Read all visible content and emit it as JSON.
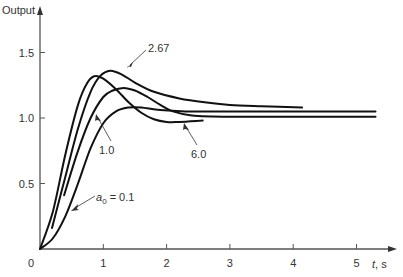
{
  "chart_data": {
    "type": "line",
    "title": "",
    "xlabel": "t, s",
    "ylabel": "Output",
    "xlim": [
      0,
      5.5
    ],
    "ylim": [
      0,
      1.6
    ],
    "grid": false,
    "legend": "inline annotations with arrows",
    "x_ticks": [
      {
        "value": 0,
        "label": "0"
      },
      {
        "value": 1,
        "label": "1"
      },
      {
        "value": 2,
        "label": "2"
      },
      {
        "value": 3,
        "label": "3"
      },
      {
        "value": 4,
        "label": "4"
      },
      {
        "value": 5,
        "label": "5"
      }
    ],
    "y_ticks": [
      {
        "value": 0.5,
        "label": "0.5"
      },
      {
        "value": 1.0,
        "label": "1.0"
      },
      {
        "value": 1.5,
        "label": "1.5"
      }
    ],
    "series": [
      {
        "name": "a0 = 6.0",
        "label": "6.0",
        "x": [
          0.0,
          0.2,
          0.4,
          0.6,
          0.75,
          0.87,
          1.0,
          1.2,
          1.4,
          1.6,
          1.8,
          2.0,
          2.2,
          2.57
        ],
        "y": [
          0.0,
          0.28,
          0.72,
          1.1,
          1.27,
          1.32,
          1.3,
          1.22,
          1.12,
          1.04,
          0.99,
          0.97,
          0.97,
          0.98
        ]
      },
      {
        "name": "a0 = 2.67",
        "label": "2.67",
        "x": [
          0.19,
          0.4,
          0.6,
          0.8,
          0.95,
          1.11,
          1.3,
          1.5,
          1.8,
          2.2,
          2.6,
          3.0,
          3.5,
          4.14
        ],
        "y": [
          0.16,
          0.55,
          0.92,
          1.2,
          1.32,
          1.36,
          1.33,
          1.27,
          1.2,
          1.15,
          1.12,
          1.1,
          1.09,
          1.08
        ]
      },
      {
        "name": "a0 = 1.0",
        "label": "1.0",
        "x": [
          0.38,
          0.6,
          0.8,
          1.0,
          1.15,
          1.32,
          1.5,
          1.7,
          1.9,
          2.1,
          2.4,
          3.0,
          4.0,
          5.3
        ],
        "y": [
          0.41,
          0.75,
          1.0,
          1.16,
          1.21,
          1.23,
          1.21,
          1.16,
          1.1,
          1.05,
          1.02,
          1.01,
          1.01,
          1.01
        ]
      },
      {
        "name": "a0 = 0.1",
        "label": "a0 = 0.1",
        "x": [
          0.0,
          0.2,
          0.4,
          0.6,
          0.8,
          1.0,
          1.2,
          1.4,
          1.6,
          1.9,
          2.3,
          3.0,
          4.0,
          5.3
        ],
        "y": [
          0.0,
          0.08,
          0.25,
          0.5,
          0.77,
          0.96,
          1.05,
          1.08,
          1.08,
          1.06,
          1.05,
          1.05,
          1.05,
          1.05
        ]
      }
    ],
    "annotations": [
      {
        "text": "2.67",
        "points_to_series": "a0 = 2.67"
      },
      {
        "text": "1.0",
        "points_to_series": "a0 = 1.0"
      },
      {
        "text": "6.0",
        "points_to_series": "a0 = 6.0"
      },
      {
        "text": "a0 = 0.1",
        "points_to_series": "a0 = 0.1"
      }
    ]
  },
  "axes": {
    "y_title": "Output",
    "x_title": "t, s",
    "origin_label": "0"
  },
  "labels": {
    "a267": "2.67",
    "a10": "1.0",
    "a60": "6.0",
    "a01_prefix": "a",
    "a01_sub": "0",
    "a01_suffix": " = 0.1"
  },
  "colors": {
    "curve": "#111111",
    "axis": "#555555",
    "text": "#333333"
  }
}
